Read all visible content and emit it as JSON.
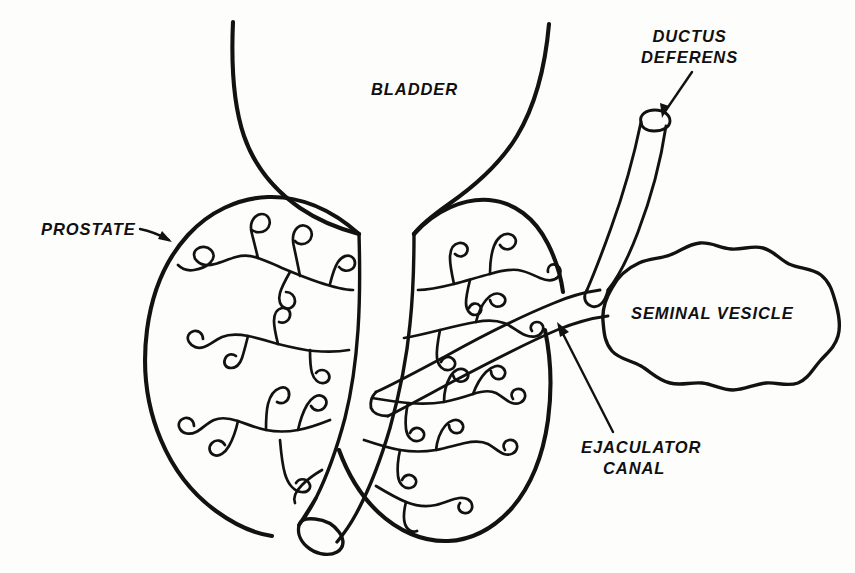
{
  "figure": {
    "kind": "anatomical-line-diagram",
    "style": "black ink line drawing on white paper",
    "width": 855,
    "height": 573,
    "ink_color": "#121212",
    "paper_color": "#fdfdfc"
  },
  "labels": {
    "bladder": "BLADDER",
    "prostate": "PROSTATE",
    "ductus_line1": "DUCTUS",
    "ductus_line2": "DEFERENS",
    "seminal_vesicle": "SEMINAL VESICLE",
    "ejaculator_line1": "EJACULATOR",
    "ejaculator_line2": "CANAL"
  },
  "structures": [
    {
      "name": "bladder-neck",
      "label": "BLADDER",
      "has_leader": false
    },
    {
      "name": "prostate-left-lobe",
      "label": "PROSTATE",
      "has_leader": true
    },
    {
      "name": "prostate-right-lobe",
      "label": "PROSTATE",
      "has_leader": true
    },
    {
      "name": "prostatic-urethra",
      "label": "",
      "has_leader": false
    },
    {
      "name": "ductus-deferens",
      "label": "DUCTUS DEFERENS",
      "has_leader": true
    },
    {
      "name": "seminal-vesicle",
      "label": "SEMINAL VESICLE",
      "has_leader": false
    },
    {
      "name": "ejaculatory-duct",
      "label": "EJACULATOR CANAL",
      "has_leader": true
    }
  ]
}
